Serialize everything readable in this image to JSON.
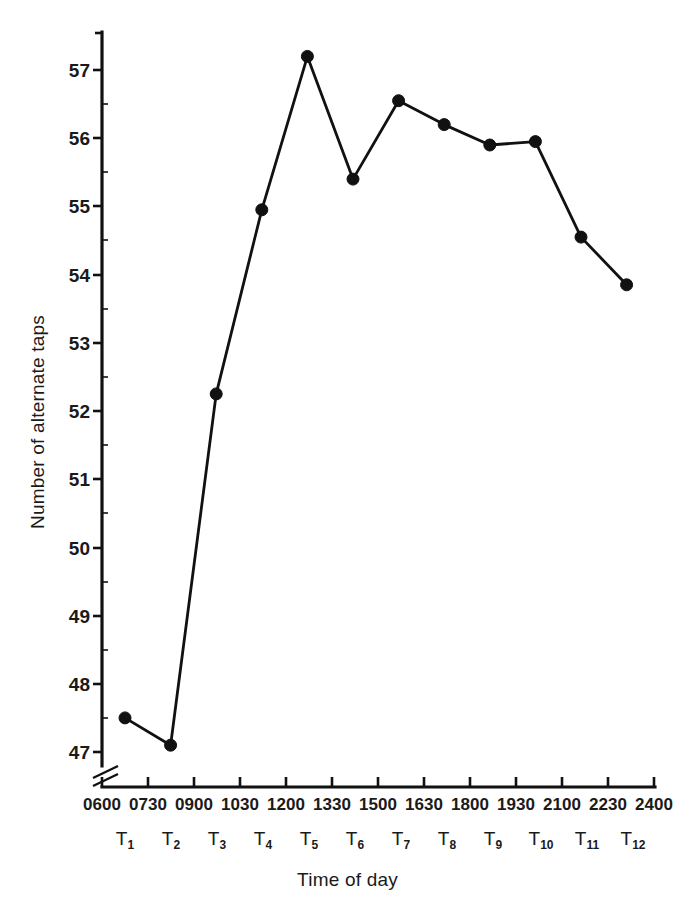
{
  "chart_data": {
    "type": "line",
    "title": "",
    "xlabel": "Time of day",
    "ylabel": "Number of alternate taps",
    "categories": [
      "T1",
      "T2",
      "T3",
      "T4",
      "T5",
      "T6",
      "T7",
      "T8",
      "T9",
      "T10",
      "T11",
      "T12"
    ],
    "x_tick_labels": [
      "0600",
      "0730",
      "0900",
      "1030",
      "1200",
      "1330",
      "1500",
      "1630",
      "1800",
      "1930",
      "2100",
      "2230",
      "2400"
    ],
    "t_labels": [
      "T1",
      "T2",
      "T3",
      "T4",
      "T5",
      "T6",
      "T7",
      "T8",
      "T9",
      "T10",
      "T11",
      "T12"
    ],
    "t_label_bases": [
      "T",
      "T",
      "T",
      "T",
      "T",
      "T",
      "T",
      "T",
      "T",
      "T",
      "T",
      "T"
    ],
    "t_label_subs": [
      "1",
      "2",
      "3",
      "4",
      "5",
      "6",
      "7",
      "8",
      "9",
      "10",
      "11",
      "12"
    ],
    "values": [
      47.5,
      47.1,
      52.25,
      54.95,
      57.2,
      55.4,
      56.55,
      56.2,
      55.9,
      55.95,
      54.55,
      53.85
    ],
    "y_tick_labels": [
      "57",
      "56",
      "55",
      "54",
      "53",
      "52",
      "51",
      "50",
      "49",
      "48",
      "47"
    ],
    "y_tick_values": [
      57,
      56,
      55,
      54,
      53,
      52,
      51,
      50,
      49,
      48,
      47
    ],
    "ylim": [
      47,
      57.5
    ],
    "axis_break": true,
    "axis_break_note": "y-axis broken below 47",
    "grid": false,
    "legend": "none",
    "marker": "filled-circle",
    "line_color": "#111111",
    "marker_color": "#111111",
    "background_color": "#ffffff"
  },
  "axis": {
    "x_title": "Time of day",
    "y_title": "Number of alternate taps"
  }
}
